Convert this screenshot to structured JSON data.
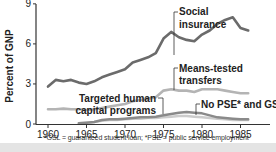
{
  "chart_data": {
    "type": "line",
    "title": "",
    "xlabel": "",
    "ylabel": "Percent of GNP",
    "xlim": [
      1959,
      1987
    ],
    "ylim": [
      0,
      9
    ],
    "xticks": [
      1960,
      1965,
      1970,
      1975,
      1980,
      1985
    ],
    "yticks": [
      0,
      3,
      6,
      9
    ],
    "grid": false,
    "legend": "inline annotations",
    "series": [
      {
        "name": "Social insurance",
        "color": "#6b6b6b",
        "x": [
          1960,
          1961,
          1962,
          1963,
          1964,
          1965,
          1966,
          1967,
          1968,
          1969,
          1970,
          1971,
          1972,
          1973,
          1974,
          1975,
          1976,
          1977,
          1978,
          1979,
          1980,
          1981,
          1982,
          1983,
          1984,
          1985,
          1986
        ],
        "values": [
          2.8,
          3.3,
          3.2,
          3.3,
          3.1,
          3.0,
          3.2,
          3.5,
          3.7,
          3.9,
          4.1,
          4.6,
          4.8,
          5.0,
          5.3,
          6.4,
          6.9,
          6.5,
          6.3,
          6.2,
          6.7,
          7.0,
          7.5,
          7.8,
          8.0,
          7.2,
          7.0
        ]
      },
      {
        "name": "Means-tested transfers",
        "color": "#b4b4b4",
        "x": [
          1960,
          1961,
          1962,
          1963,
          1964,
          1965,
          1966,
          1967,
          1968,
          1969,
          1970,
          1971,
          1972,
          1973,
          1974,
          1975,
          1976,
          1977,
          1978,
          1979,
          1980,
          1981,
          1982,
          1983,
          1984,
          1985,
          1986
        ],
        "values": [
          1.1,
          1.1,
          1.15,
          1.1,
          1.1,
          1.05,
          1.1,
          1.2,
          1.3,
          1.4,
          1.5,
          1.7,
          1.8,
          1.9,
          2.0,
          2.5,
          2.6,
          2.5,
          2.5,
          2.4,
          2.6,
          2.6,
          2.6,
          2.5,
          2.4,
          2.3,
          2.3
        ]
      },
      {
        "name": "Targeted human capital programs",
        "color": "#8a8a8a",
        "x": [
          1964,
          1965,
          1966,
          1967,
          1968,
          1969,
          1970,
          1971,
          1972,
          1973,
          1974,
          1975,
          1976,
          1977,
          1978,
          1979,
          1980,
          1981,
          1982,
          1983,
          1984,
          1985,
          1986
        ],
        "values": [
          0.05,
          0.1,
          0.15,
          0.3,
          0.35,
          0.35,
          0.4,
          0.45,
          0.5,
          0.5,
          0.55,
          0.65,
          0.75,
          0.85,
          0.9,
          0.85,
          0.8,
          0.65,
          0.5,
          0.45,
          0.4,
          0.35,
          0.35
        ]
      },
      {
        "name": "No PSE* and GSL*",
        "color": "#cccccc",
        "x": [
          1964,
          1965,
          1966,
          1967,
          1968,
          1969,
          1970,
          1971,
          1972,
          1973,
          1974,
          1975,
          1976,
          1977,
          1978,
          1979,
          1980,
          1981,
          1982,
          1983,
          1984,
          1985,
          1986
        ],
        "values": [
          0.05,
          0.1,
          0.15,
          0.25,
          0.3,
          0.3,
          0.35,
          0.4,
          0.4,
          0.45,
          0.45,
          0.5,
          0.55,
          0.6,
          0.6,
          0.55,
          0.5,
          0.45,
          0.4,
          0.35,
          0.3,
          0.3,
          0.3
        ]
      }
    ],
    "annotations": [
      {
        "lines": [
          "Social",
          "insurance"
        ],
        "series": "Social insurance"
      },
      {
        "lines": [
          "Means-tested",
          "transfers"
        ],
        "series": "Means-tested transfers"
      },
      {
        "lines": [
          "Targeted human",
          "capital programs"
        ],
        "series": "Targeted human capital programs"
      },
      {
        "lines": [
          "No PSE* and GSL*"
        ],
        "series": "No PSE* and GSL*"
      }
    ],
    "footnote": "*GSL = guaranteed student loan; *PSE = public service employment"
  }
}
